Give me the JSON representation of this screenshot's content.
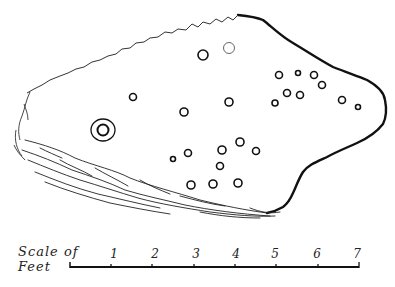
{
  "figure": {
    "type": "archaeological drawing",
    "stroke_color": "#111111",
    "background": "#ffffff"
  },
  "scale": {
    "label_line1": "Scale of",
    "label_line2": "Feet",
    "ticks": [
      "1",
      "2",
      "3",
      "4",
      "5",
      "6",
      "7"
    ],
    "unit": "Feet"
  },
  "cup_marks": [
    {
      "x": 203,
      "y": 55,
      "r": 5
    },
    {
      "x": 229,
      "y": 48,
      "r": 5.5,
      "light": true
    },
    {
      "x": 133,
      "y": 97,
      "r": 3.5
    },
    {
      "x": 184,
      "y": 112,
      "r": 4
    },
    {
      "x": 229,
      "y": 102,
      "r": 4
    },
    {
      "x": 279,
      "y": 75,
      "r": 3.5
    },
    {
      "x": 298,
      "y": 73,
      "r": 2.5
    },
    {
      "x": 314,
      "y": 75,
      "r": 3.5
    },
    {
      "x": 322,
      "y": 85,
      "r": 3.5
    },
    {
      "x": 287,
      "y": 93,
      "r": 3.5
    },
    {
      "x": 300,
      "y": 95,
      "r": 3.5
    },
    {
      "x": 275,
      "y": 103,
      "r": 3
    },
    {
      "x": 342,
      "y": 100,
      "r": 3.5
    },
    {
      "x": 358,
      "y": 107,
      "r": 2.5
    },
    {
      "x": 173,
      "y": 159,
      "r": 2.5
    },
    {
      "x": 188,
      "y": 153,
      "r": 3.5
    },
    {
      "x": 222,
      "y": 150,
      "r": 4
    },
    {
      "x": 240,
      "y": 142,
      "r": 4
    },
    {
      "x": 256,
      "y": 151,
      "r": 3.5
    },
    {
      "x": 220,
      "y": 166,
      "r": 3.5
    },
    {
      "x": 191,
      "y": 185,
      "r": 4
    },
    {
      "x": 213,
      "y": 184,
      "r": 4
    },
    {
      "x": 238,
      "y": 183,
      "r": 4
    }
  ],
  "ring_mark": {
    "cx": 103,
    "cy": 130,
    "inner_r": 5.5,
    "outer_rx": 12,
    "outer_ry": 11
  }
}
